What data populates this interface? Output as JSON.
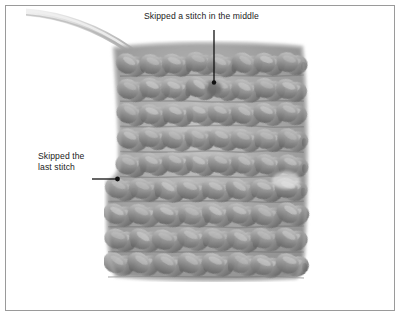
{
  "figure": {
    "kind": "photograph-with-callouts",
    "background_color": "#ffffff",
    "frame": {
      "border_color": "#9a9a9a",
      "border_width_px": 1
    }
  },
  "photo": {
    "yarn": {
      "color_light": "#c4c4c4",
      "color_mid": "#9d9d9d",
      "color_shadow": "#6d6d6d",
      "tail_color": "#d9d9d9"
    },
    "swatch": {
      "rows": 9,
      "stitches_per_row": 8
    }
  },
  "annotations": [
    {
      "id": "middle",
      "text": "Skipped a stitch in the middle",
      "leader": "vertical-line-with-dot",
      "color": "#1b1b1b"
    },
    {
      "id": "last",
      "line1": "Skipped the",
      "line2": "last stitch",
      "leader": "horizontal-arrow-with-dot",
      "color": "#1b1b1b"
    }
  ]
}
